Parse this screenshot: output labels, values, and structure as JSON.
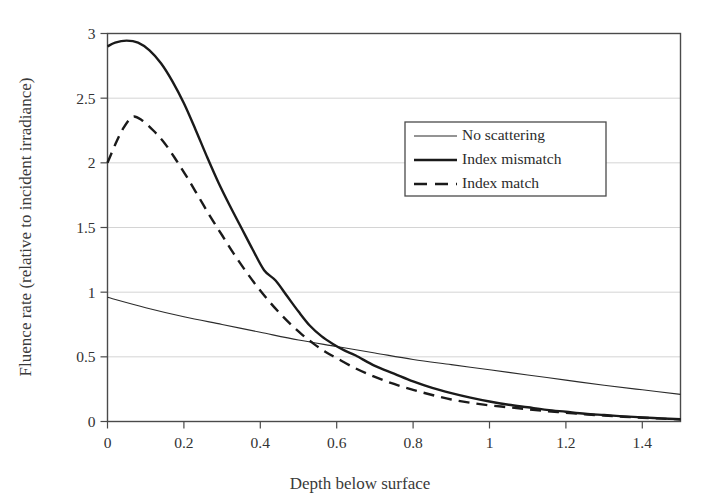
{
  "chart_data": {
    "type": "line",
    "title": "",
    "xlabel": "Depth below surface",
    "ylabel": "Fluence rate (relative to incident irradiance)",
    "xlim": [
      0,
      1.5
    ],
    "ylim": [
      0,
      3
    ],
    "xticks": [
      "0",
      "0.2",
      "0.4",
      "0.6",
      "0.8",
      "1",
      "1.2",
      "1.4"
    ],
    "xtick_values": [
      0,
      0.2,
      0.4,
      0.6,
      0.8,
      1.0,
      1.2,
      1.4
    ],
    "yticks": [
      "0",
      "0.5",
      "1",
      "1.5",
      "2",
      "2.5",
      "3"
    ],
    "ytick_values": [
      0,
      0.5,
      1,
      1.5,
      2,
      2.5,
      3
    ],
    "grid": "horizontal",
    "grid_color": "#c9c9c9",
    "axis_color": "#4a4a4a",
    "legend_position": "upper-right-inside",
    "series": [
      {
        "name": "No scattering",
        "style": "solid-thin",
        "color": "#2b2b2b",
        "width": 1.1,
        "x": [
          0.0,
          0.1,
          0.2,
          0.3,
          0.4,
          0.5,
          0.6,
          0.7,
          0.8,
          0.9,
          1.0,
          1.1,
          1.2,
          1.3,
          1.4,
          1.5
        ],
        "y": [
          0.96,
          0.88,
          0.81,
          0.75,
          0.69,
          0.63,
          0.58,
          0.53,
          0.48,
          0.44,
          0.4,
          0.36,
          0.32,
          0.28,
          0.245,
          0.21
        ]
      },
      {
        "name": "Index mismatch",
        "style": "solid-thick",
        "color": "#1a1a1a",
        "width": 2.4,
        "x": [
          0.0,
          0.02,
          0.05,
          0.08,
          0.11,
          0.14,
          0.17,
          0.2,
          0.23,
          0.26,
          0.29,
          0.32,
          0.35,
          0.38,
          0.41,
          0.44,
          0.47,
          0.5,
          0.53,
          0.56,
          0.59,
          0.62,
          0.65,
          0.7,
          0.75,
          0.8,
          0.85,
          0.9,
          0.95,
          1.0,
          1.05,
          1.1,
          1.15,
          1.2,
          1.25,
          1.3,
          1.35,
          1.4,
          1.45,
          1.5
        ],
        "y": [
          2.9,
          2.93,
          2.945,
          2.93,
          2.87,
          2.77,
          2.63,
          2.46,
          2.26,
          2.05,
          1.85,
          1.67,
          1.5,
          1.33,
          1.17,
          1.09,
          0.97,
          0.85,
          0.74,
          0.66,
          0.6,
          0.55,
          0.51,
          0.43,
          0.37,
          0.31,
          0.26,
          0.22,
          0.185,
          0.155,
          0.13,
          0.11,
          0.09,
          0.075,
          0.06,
          0.05,
          0.04,
          0.032,
          0.024,
          0.018
        ]
      },
      {
        "name": "Index match",
        "style": "dashed-thick",
        "color": "#1a1a1a",
        "width": 2.4,
        "x": [
          0.0,
          0.02,
          0.04,
          0.065,
          0.09,
          0.12,
          0.15,
          0.18,
          0.21,
          0.24,
          0.27,
          0.3,
          0.33,
          0.36,
          0.39,
          0.42,
          0.45,
          0.48,
          0.51,
          0.54,
          0.57,
          0.6,
          0.65,
          0.7,
          0.75,
          0.8,
          0.85,
          0.9,
          0.95,
          1.0,
          1.05,
          1.1,
          1.15,
          1.2,
          1.25,
          1.3,
          1.35,
          1.4,
          1.45,
          1.5
        ],
        "y": [
          2.0,
          2.14,
          2.26,
          2.355,
          2.33,
          2.25,
          2.15,
          2.02,
          1.88,
          1.73,
          1.58,
          1.44,
          1.3,
          1.17,
          1.05,
          0.94,
          0.84,
          0.75,
          0.67,
          0.6,
          0.54,
          0.49,
          0.41,
          0.345,
          0.29,
          0.245,
          0.205,
          0.17,
          0.145,
          0.125,
          0.11,
          0.095,
          0.08,
          0.068,
          0.056,
          0.046,
          0.037,
          0.029,
          0.022,
          0.016
        ]
      }
    ]
  },
  "legend": {
    "items": [
      {
        "label": "No scattering"
      },
      {
        "label": "Index mismatch"
      },
      {
        "label": "Index match"
      }
    ]
  },
  "axes": {
    "x_title": "Depth below surface",
    "y_title": "Fluence rate (relative to incident irradiance)"
  }
}
